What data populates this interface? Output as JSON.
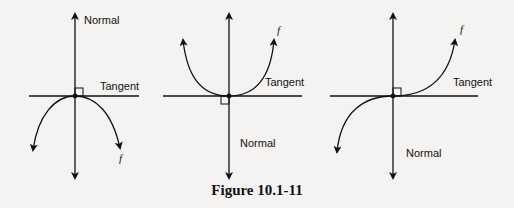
{
  "figure": {
    "caption": "Figure 10.1-11",
    "panels": [
      {
        "name": "concave-down",
        "normal_label": "Normal",
        "tangent_label": "Tangent",
        "function_label": "f"
      },
      {
        "name": "concave-up",
        "normal_label": "Normal",
        "tangent_label": "Tangent",
        "function_label": "f"
      },
      {
        "name": "inflection",
        "normal_label": "Normal",
        "tangent_label": "Tangent",
        "function_label": "f"
      }
    ]
  }
}
